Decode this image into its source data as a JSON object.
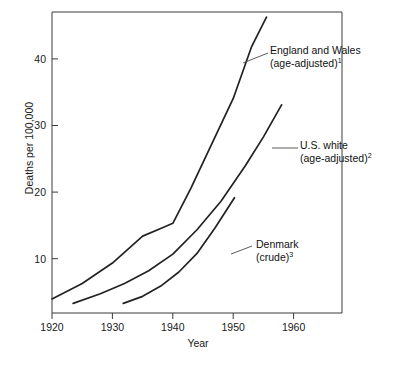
{
  "chart_data": {
    "type": "line",
    "title": "",
    "xlabel": "Year",
    "ylabel": "Deaths per 100,000",
    "xlim": [
      1920,
      1968
    ],
    "ylim": [
      0,
      47
    ],
    "grid": false,
    "legend_position": "inline-annotations",
    "xticks": [
      1920,
      1930,
      1940,
      1950,
      1960
    ],
    "xtick_labels": [
      "1920",
      "1930",
      "1940",
      "1950",
      "1960"
    ],
    "yticks": [
      10,
      20,
      30,
      40
    ],
    "ytick_labels": [
      "10",
      "20",
      "30",
      "40"
    ],
    "series": [
      {
        "name": "England and Wales (age-adjusted)",
        "footnote": "1",
        "label_line1": "England and Wales",
        "label_line2": "(age-adjusted)",
        "x": [
          1920,
          1925,
          1930,
          1935,
          1938,
          1940,
          1943,
          1946,
          1950,
          1953,
          1955.5
        ],
        "values": [
          2.2,
          4.6,
          7.8,
          12.0,
          13.2,
          14.0,
          19.5,
          25.5,
          33.5,
          41.5,
          46.2
        ]
      },
      {
        "name": "U.S. white (age-adjusted)",
        "footnote": "2",
        "label_line1": "U.S. white",
        "label_line2": "(age-adjusted)",
        "x": [
          1923.5,
          1928,
          1932,
          1936,
          1940,
          1944,
          1948,
          1952,
          1955,
          1958
        ],
        "values": [
          1.5,
          3.0,
          4.6,
          6.6,
          9.2,
          13.0,
          17.5,
          23.0,
          27.5,
          32.5
        ]
      },
      {
        "name": "Denmark (crude)",
        "footnote": "3",
        "label_line1": "Denmark",
        "label_line2": "(crude)",
        "x": [
          1931.8,
          1935,
          1938,
          1941,
          1944,
          1947,
          1950.2
        ],
        "values": [
          1.5,
          2.6,
          4.2,
          6.4,
          9.3,
          13.3,
          18.0
        ]
      }
    ]
  },
  "annotations": {
    "england": {
      "line1": "England and Wales",
      "line2": "(age-adjusted)",
      "note": "1"
    },
    "us": {
      "line1": "U.S. white",
      "line2": "(age-adjusted)",
      "note": "2"
    },
    "denmark": {
      "line1": "Denmark",
      "line2": "(crude)",
      "note": "3"
    }
  },
  "axis": {
    "y_title": "Deaths per 100,000",
    "x_title": "Year",
    "ytick_0": "10",
    "ytick_1": "20",
    "ytick_2": "30",
    "ytick_3": "40",
    "xtick_0": "1920",
    "xtick_1": "1930",
    "xtick_2": "1940",
    "xtick_3": "1950",
    "xtick_4": "1960"
  },
  "colors": {
    "line": "#222222",
    "axis": "#3a3a3a",
    "background": "#ffffff"
  }
}
